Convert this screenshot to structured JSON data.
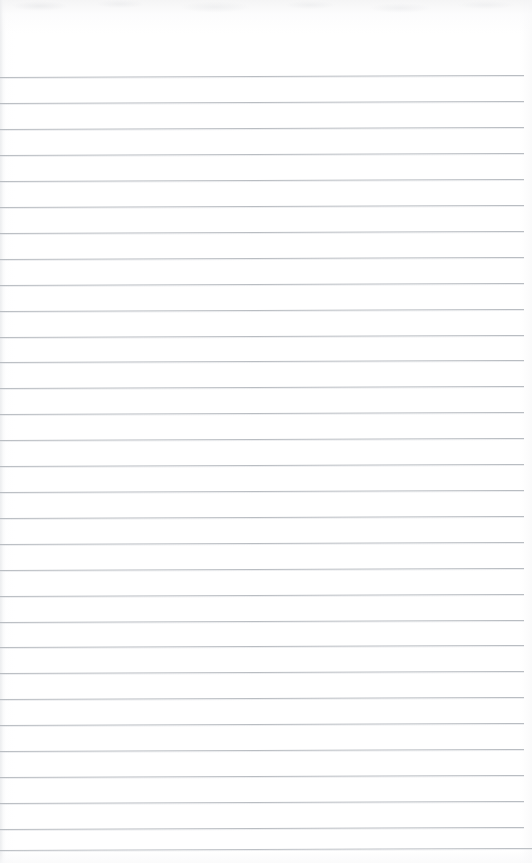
{
  "document": {
    "type": "blank-ruled-notepad-page",
    "title": "Blank Ruled Notepad Page",
    "page_width": 532,
    "page_height": 863,
    "paper_color": "#ffffff",
    "rule_color": "#b9bdc2",
    "has_text": false,
    "has_margin_rule": false,
    "header_area_height": 77,
    "visible_text": "",
    "rules": {
      "count": 31,
      "first_line_y": 77,
      "spacing": 25.8,
      "line_left": 0,
      "line_right": 524,
      "line_thickness": 1,
      "slant_px": -2,
      "lines_y": [
        77,
        103,
        129,
        155,
        181,
        207,
        233,
        259,
        285,
        311,
        337,
        362,
        388,
        414,
        440,
        466,
        492,
        518,
        544,
        570,
        596,
        622,
        647,
        673,
        699,
        725,
        751,
        777,
        803,
        829,
        850
      ],
      "line_widths": [
        524,
        524,
        524,
        524,
        524,
        524,
        524,
        524,
        524,
        524,
        524,
        524,
        524,
        524,
        524,
        524,
        524,
        524,
        524,
        524,
        524,
        524,
        524,
        524,
        524,
        524,
        524,
        524,
        524,
        524,
        532
      ]
    }
  }
}
